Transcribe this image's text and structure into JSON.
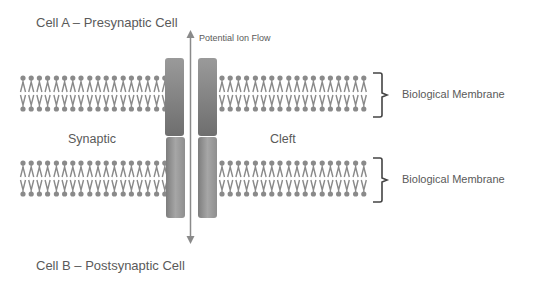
{
  "diagram": {
    "cell_a_label": "Cell A – Presynaptic Cell",
    "cell_b_label": "Cell B – Postsynaptic Cell",
    "arrow_label": "Potential Ion Flow",
    "cleft_left_label": "Synaptic",
    "cleft_right_label": "Cleft",
    "membranes": [
      {
        "label": "Biological Membrane"
      },
      {
        "label": "Biological Membrane"
      }
    ],
    "colors": {
      "lipid": "#8a8a8a",
      "channel_light": "#a8a8a8",
      "channel_dark": "#7a7a7a",
      "text": "#5a5a5a",
      "bracket": "#444444"
    }
  }
}
